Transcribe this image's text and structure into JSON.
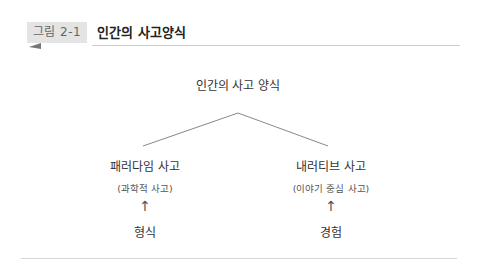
{
  "figure": {
    "tag": "그림 2-1",
    "title": "인간의 사고양식"
  },
  "diagram": {
    "root": "인간의 사고 양식",
    "branches": [
      {
        "label": "패러다임 사고",
        "sublabel": "(과학적 사고)",
        "arrow": "↑",
        "source": "형식"
      },
      {
        "label": "내러티브 사고",
        "sublabel": "(이야기 중심 사고)",
        "arrow": "↑",
        "source": "경험"
      }
    ]
  },
  "colors": {
    "tag_bg": "#e4e4e4",
    "line": "#888888"
  }
}
